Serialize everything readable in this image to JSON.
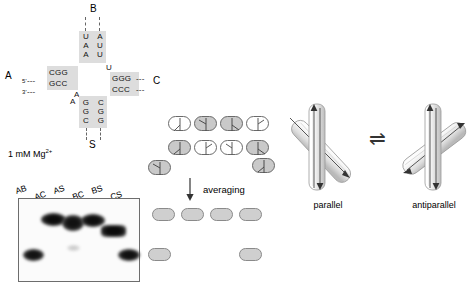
{
  "figure": {
    "accent_gray": "#dddddd",
    "line_gray": "#6a6a6a"
  },
  "junction": {
    "arm_labels": {
      "top": "B",
      "left": "A",
      "right": "C",
      "bottom": "S"
    },
    "left_arm": {
      "five_prime": "5'",
      "three_prime": "3'",
      "top_strand": "CGG",
      "bottom_strand": "GCC",
      "dash": "---"
    },
    "right_arm": {
      "top_strand": "GGG",
      "bottom_strand": "CCC",
      "dash": "---"
    },
    "top_stem": {
      "left_column": [
        "U",
        "A",
        "A"
      ],
      "right_column": [
        "A",
        "U",
        "U"
      ]
    },
    "bottom_stem": {
      "left_column": [
        "G",
        "G",
        "C"
      ],
      "right_column": [
        "C",
        "G",
        "G"
      ]
    },
    "loose_bases": {
      "center_right": "U",
      "lower_left_upper": "A",
      "lower_left_lower": "A"
    }
  },
  "gel": {
    "condition_label": "1 mM Mg",
    "condition_superscript": "2+",
    "lane_labels": [
      "AB",
      "AC",
      "AS",
      "BC",
      "BS",
      "CS"
    ],
    "bands": [
      {
        "lane": "AB",
        "mobility": "fast",
        "intensity": "strong"
      },
      {
        "lane": "AC",
        "mobility": "slow",
        "intensity": "strong"
      },
      {
        "lane": "AS",
        "mobility": "slow",
        "intensity": "strong"
      },
      {
        "lane": "BC",
        "mobility": "slow",
        "intensity": "strong"
      },
      {
        "lane": "BS",
        "mobility": "medium",
        "intensity": "strong"
      },
      {
        "lane": "CS",
        "mobility": "fast",
        "intensity": "strong"
      }
    ]
  },
  "averaging": {
    "label": "averaging",
    "arrow": "down-arrow",
    "conformer_rows": {
      "row1_count": 4,
      "row2_count": 4,
      "outlier_left_count": 1,
      "outlier_right_count": 1
    },
    "averaged_rows": {
      "row1_count": 4,
      "outlier_right_count": 1
    }
  },
  "equilibrium": {
    "symbol": "⇌",
    "left_label": "parallel",
    "right_label": "antiparallel"
  }
}
